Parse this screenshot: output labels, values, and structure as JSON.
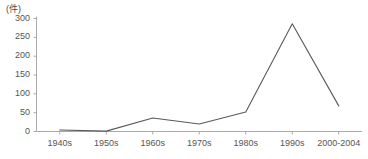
{
  "chart_data": {
    "type": "line",
    "title": "",
    "subtitle": "",
    "xlabel": "",
    "ylabel": "",
    "unit_label": "(件)",
    "categories": [
      "1940s",
      "1950s",
      "1960s",
      "1970s",
      "1980s",
      "1990s",
      "2000-2004"
    ],
    "values": [
      4,
      1,
      36,
      20,
      52,
      286,
      68
    ],
    "series": [
      {
        "name": "件数",
        "values": [
          4,
          1,
          36,
          20,
          52,
          286,
          68
        ]
      }
    ],
    "ylim": [
      0,
      300
    ],
    "yticks": [
      0,
      50,
      100,
      150,
      200,
      250,
      300
    ],
    "ytick_labels": [
      "0",
      "50",
      "100",
      "150",
      "200",
      "250",
      "300"
    ],
    "grid": false,
    "legend": "none",
    "line_color": "#595959",
    "axis_color": "#aaaaaa",
    "text_color": "#555555",
    "background_color": "#ffffff"
  }
}
